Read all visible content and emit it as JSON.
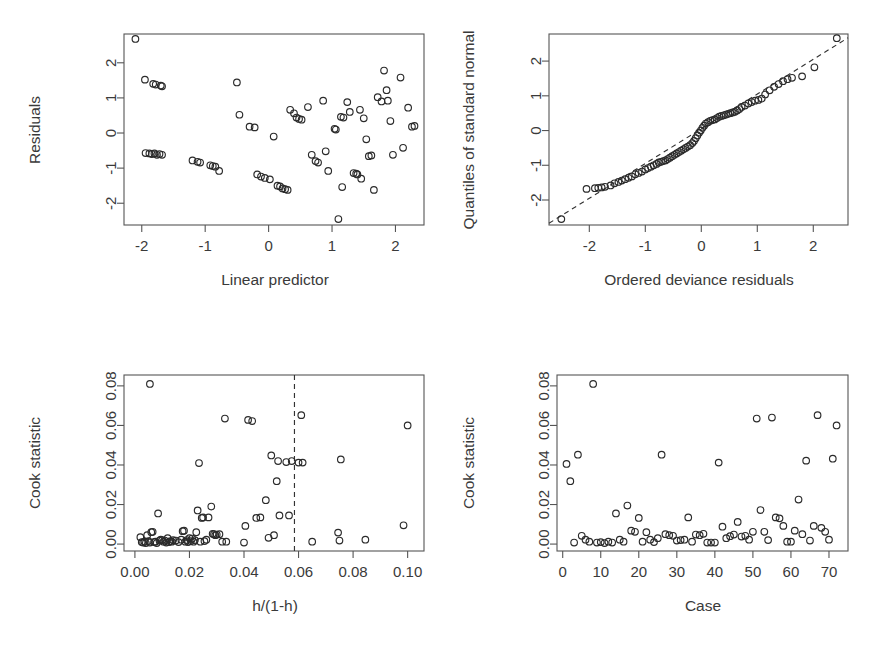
{
  "figure": {
    "title": "",
    "background": "#ffffff",
    "point_color": "#2b2b2b",
    "axis_color": "#555555",
    "layout": "2x2 grid of diagnostic scatter plots"
  },
  "chart_data": [
    {
      "id": "residuals-vs-linear-predictor",
      "type": "scatter",
      "title": "",
      "xlabel": "Linear predictor",
      "ylabel": "Residuals",
      "xlim": [
        -2.28,
        2.45
      ],
      "ylim": [
        -2.62,
        2.82
      ],
      "xticks": [
        -2,
        -1,
        0,
        1,
        2
      ],
      "yticks": [
        -2,
        -1,
        0,
        1,
        2
      ],
      "xticklabels": [
        "-2",
        "-1",
        "0",
        "1",
        "2"
      ],
      "yticklabels": [
        "-2",
        "-1",
        "0",
        "1",
        "2"
      ],
      "grid": false,
      "legend": false,
      "marker": "open-circle",
      "x": [
        -2.1,
        -1.95,
        -1.82,
        -1.78,
        -1.7,
        -1.68,
        -1.94,
        -1.88,
        -1.84,
        -1.8,
        -1.76,
        -1.72,
        -1.68,
        -1.2,
        -1.12,
        -1.08,
        -0.92,
        -0.88,
        -0.84,
        -0.78,
        -0.5,
        -0.46,
        -0.3,
        -0.22,
        -0.18,
        -0.12,
        -0.06,
        0.02,
        0.08,
        0.14,
        0.18,
        0.22,
        0.26,
        0.3,
        0.34,
        0.4,
        0.44,
        0.48,
        0.52,
        0.62,
        0.68,
        0.74,
        0.78,
        0.86,
        0.9,
        0.94,
        1.04,
        1.06,
        1.1,
        1.14,
        1.16,
        1.18,
        1.24,
        1.28,
        1.34,
        1.38,
        1.4,
        1.44,
        1.46,
        1.5,
        1.54,
        1.58,
        1.62,
        1.66,
        1.72,
        1.78,
        1.82,
        1.86,
        1.88,
        1.92,
        1.96,
        2.08,
        2.12,
        2.2,
        2.26,
        2.3
      ],
      "y": [
        2.68,
        1.52,
        1.4,
        1.38,
        1.35,
        1.33,
        -0.57,
        -0.58,
        -0.6,
        -0.58,
        -0.62,
        -0.6,
        -0.62,
        -0.78,
        -0.82,
        -0.84,
        -0.92,
        -0.94,
        -0.96,
        -1.08,
        1.44,
        0.52,
        0.18,
        0.16,
        -1.18,
        -1.24,
        -1.28,
        -1.32,
        -0.1,
        -1.5,
        -1.52,
        -1.58,
        -1.6,
        -1.62,
        0.66,
        0.56,
        0.44,
        0.4,
        0.38,
        0.74,
        -0.62,
        -0.8,
        -0.84,
        0.92,
        -0.52,
        -1.08,
        0.12,
        0.1,
        -2.45,
        0.46,
        -1.54,
        0.44,
        0.88,
        0.6,
        -1.14,
        -1.16,
        -1.18,
        0.66,
        -1.3,
        0.42,
        -0.18,
        -0.66,
        -0.64,
        -1.62,
        1.02,
        0.9,
        1.78,
        1.22,
        0.92,
        0.34,
        -0.62,
        1.58,
        -0.42,
        0.72,
        0.18,
        0.2
      ]
    },
    {
      "id": "qq-plot-deviance-residuals",
      "type": "scatter",
      "title": "",
      "xlabel": "Ordered deviance residuals",
      "ylabel": "Quantiles of standard normal",
      "xlim": [
        -2.72,
        2.62
      ],
      "ylim": [
        -2.72,
        2.78
      ],
      "xticks": [
        -2,
        -1,
        0,
        1,
        2
      ],
      "yticks": [
        -2,
        -1,
        0,
        1,
        2
      ],
      "xticklabels": [
        "-2",
        "-1",
        "0",
        "1",
        "2"
      ],
      "yticklabels": [
        "-2",
        "-1",
        "0",
        "1",
        "2"
      ],
      "grid": false,
      "legend": false,
      "marker": "open-circle",
      "reference_line": {
        "type": "dashed-identity",
        "slope": 1.0,
        "intercept": 0.05
      },
      "x": [
        -2.5,
        -2.05,
        -1.9,
        -1.84,
        -1.78,
        -1.72,
        -1.62,
        -1.55,
        -1.48,
        -1.42,
        -1.36,
        -1.3,
        -1.24,
        -1.18,
        -1.12,
        -1.06,
        -1.0,
        -0.95,
        -0.9,
        -0.85,
        -0.8,
        -0.76,
        -0.72,
        -0.68,
        -0.64,
        -0.6,
        -0.56,
        -0.52,
        -0.48,
        -0.44,
        -0.4,
        -0.36,
        -0.32,
        -0.28,
        -0.24,
        -0.2,
        -0.16,
        -0.13,
        -0.1,
        -0.07,
        -0.04,
        -0.01,
        0.02,
        0.05,
        0.08,
        0.12,
        0.16,
        0.2,
        0.24,
        0.28,
        0.32,
        0.36,
        0.4,
        0.44,
        0.48,
        0.52,
        0.56,
        0.6,
        0.64,
        0.68,
        0.72,
        0.78,
        0.84,
        0.9,
        0.96,
        1.02,
        1.08,
        1.14,
        1.22,
        1.3,
        1.38,
        1.46,
        1.54,
        1.62,
        1.8,
        2.02,
        2.42
      ],
      "y": [
        -2.55,
        -1.68,
        -1.66,
        -1.65,
        -1.64,
        -1.62,
        -1.58,
        -1.52,
        -1.48,
        -1.44,
        -1.4,
        -1.36,
        -1.32,
        -1.26,
        -1.22,
        -1.18,
        -1.12,
        -1.08,
        -1.04,
        -1.0,
        -0.96,
        -0.92,
        -0.9,
        -0.88,
        -0.86,
        -0.82,
        -0.78,
        -0.74,
        -0.7,
        -0.66,
        -0.62,
        -0.58,
        -0.54,
        -0.5,
        -0.46,
        -0.42,
        -0.36,
        -0.3,
        -0.22,
        -0.14,
        -0.06,
        0.0,
        0.08,
        0.14,
        0.2,
        0.24,
        0.28,
        0.3,
        0.32,
        0.36,
        0.4,
        0.42,
        0.44,
        0.46,
        0.48,
        0.5,
        0.52,
        0.54,
        0.58,
        0.62,
        0.68,
        0.72,
        0.78,
        0.82,
        0.86,
        0.88,
        0.92,
        1.04,
        1.16,
        1.26,
        1.34,
        1.42,
        1.48,
        1.52,
        1.56,
        1.82,
        2.66
      ]
    },
    {
      "id": "cook-statistic-vs-leverage",
      "type": "scatter",
      "title": "",
      "xlabel": "h/(1-h)",
      "ylabel": "Cook statistic",
      "xlim": [
        -0.004,
        0.106
      ],
      "ylim": [
        -0.0035,
        0.0855
      ],
      "xticks": [
        0.0,
        0.02,
        0.04,
        0.06,
        0.08,
        0.1
      ],
      "yticks": [
        0.0,
        0.02,
        0.04,
        0.06,
        0.08
      ],
      "xticklabels": [
        "0.00",
        "0.02",
        "0.04",
        "0.06",
        "0.08",
        "0.10"
      ],
      "yticklabels": [
        "0.00",
        "0.02",
        "0.04",
        "0.06",
        "0.08"
      ],
      "grid": false,
      "legend": false,
      "marker": "open-circle",
      "vline": {
        "x": 0.0585,
        "style": "dashed"
      },
      "x": [
        0.0055,
        0.002,
        0.0025,
        0.003,
        0.0035,
        0.004,
        0.0045,
        0.005,
        0.0055,
        0.006,
        0.0065,
        0.007,
        0.0075,
        0.008,
        0.0085,
        0.009,
        0.0095,
        0.01,
        0.0105,
        0.011,
        0.0115,
        0.012,
        0.0125,
        0.013,
        0.0135,
        0.014,
        0.015,
        0.016,
        0.017,
        0.0175,
        0.018,
        0.0185,
        0.019,
        0.0195,
        0.02,
        0.0205,
        0.021,
        0.0215,
        0.022,
        0.0225,
        0.023,
        0.0235,
        0.024,
        0.0245,
        0.025,
        0.0255,
        0.0262,
        0.027,
        0.028,
        0.0285,
        0.029,
        0.0295,
        0.03,
        0.031,
        0.032,
        0.033,
        0.0335,
        0.04,
        0.0405,
        0.0415,
        0.043,
        0.0445,
        0.046,
        0.048,
        0.049,
        0.05,
        0.051,
        0.052,
        0.0525,
        0.053,
        0.0555,
        0.0565,
        0.0575,
        0.06,
        0.061,
        0.0615,
        0.065,
        0.0745,
        0.075,
        0.0755,
        0.0845,
        0.0985,
        0.1
      ],
      "y": [
        0.081,
        0.0035,
        0.001,
        0.0008,
        0.0012,
        0.0005,
        0.0045,
        0.0015,
        0.0008,
        0.006,
        0.0062,
        0.001,
        0.0012,
        0.0005,
        0.0155,
        0.0018,
        0.0022,
        0.002,
        0.0012,
        0.0018,
        0.0008,
        0.003,
        0.001,
        0.0015,
        0.0012,
        0.002,
        0.0018,
        0.001,
        0.0022,
        0.0065,
        0.0068,
        0.0012,
        0.002,
        0.001,
        0.003,
        0.0015,
        0.0028,
        0.0012,
        0.002,
        0.006,
        0.017,
        0.041,
        0.0012,
        0.0132,
        0.0135,
        0.0015,
        0.0022,
        0.0135,
        0.019,
        0.0052,
        0.005,
        0.0045,
        0.0048,
        0.005,
        0.0012,
        0.0635,
        0.0012,
        0.0008,
        0.0092,
        0.0628,
        0.0622,
        0.0132,
        0.0135,
        0.0222,
        0.0032,
        0.0448,
        0.0045,
        0.0318,
        0.042,
        0.0145,
        0.0415,
        0.0145,
        0.042,
        0.0412,
        0.0652,
        0.0412,
        0.0012,
        0.0058,
        0.0018,
        0.0428,
        0.0022,
        0.0095,
        0.06
      ]
    },
    {
      "id": "cook-statistic-vs-case",
      "type": "scatter",
      "title": "",
      "xlabel": "Case",
      "ylabel": "Cook statistic",
      "xlim": [
        -1.5,
        75
      ],
      "ylim": [
        -0.0035,
        0.0855
      ],
      "xticks": [
        0,
        10,
        20,
        30,
        40,
        50,
        60,
        70
      ],
      "yticks": [
        0.0,
        0.02,
        0.04,
        0.06,
        0.08
      ],
      "xticklabels": [
        "0",
        "10",
        "20",
        "30",
        "40",
        "50",
        "60",
        "70"
      ],
      "yticklabels": [
        "0.00",
        "0.02",
        "0.04",
        "0.06",
        "0.08"
      ],
      "grid": false,
      "legend": false,
      "marker": "open-circle",
      "x": [
        1,
        2,
        3,
        4,
        5,
        6,
        7,
        8,
        9,
        10,
        11,
        12,
        13,
        14,
        15,
        16,
        17,
        18,
        19,
        20,
        21,
        22,
        23,
        24,
        25,
        26,
        27,
        28,
        29,
        30,
        31,
        32,
        33,
        34,
        35,
        36,
        37,
        38,
        39,
        40,
        41,
        42,
        43,
        44,
        45,
        46,
        47,
        48,
        49,
        50,
        51,
        52,
        53,
        54,
        55,
        56,
        57,
        58,
        59,
        60,
        61,
        62,
        63,
        64,
        65,
        66,
        67,
        68,
        69,
        70,
        71,
        72
      ],
      "y": [
        0.0405,
        0.0318,
        0.0008,
        0.0452,
        0.0042,
        0.0022,
        0.0012,
        0.081,
        0.0008,
        0.001,
        0.0005,
        0.0012,
        0.0008,
        0.0155,
        0.0022,
        0.0012,
        0.0195,
        0.0068,
        0.0062,
        0.0132,
        0.0012,
        0.006,
        0.0022,
        0.001,
        0.003,
        0.0452,
        0.005,
        0.0045,
        0.0042,
        0.0018,
        0.002,
        0.0022,
        0.0135,
        0.0012,
        0.0048,
        0.0045,
        0.0052,
        0.0008,
        0.0008,
        0.0008,
        0.0412,
        0.0088,
        0.003,
        0.004,
        0.0048,
        0.0112,
        0.0038,
        0.0042,
        0.0022,
        0.0062,
        0.0635,
        0.0172,
        0.0062,
        0.002,
        0.064,
        0.0135,
        0.013,
        0.0092,
        0.0012,
        0.0012,
        0.0068,
        0.0225,
        0.005,
        0.0422,
        0.0018,
        0.0092,
        0.0652,
        0.0082,
        0.0062,
        0.0022,
        0.0432,
        0.06
      ]
    }
  ]
}
